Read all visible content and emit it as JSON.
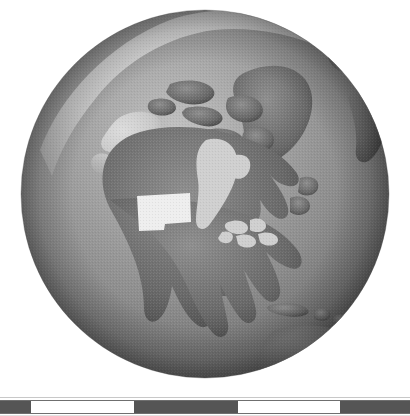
{
  "figure": {
    "kind": "globe-orthographic-projection",
    "view_center": "North America",
    "background_color": "#ffffff",
    "rendering": "grayscale halftone raster"
  },
  "globe": {
    "center_x": 205,
    "center_y": 194,
    "radius": 184,
    "ocean_color": "#8b8b8b",
    "ocean_shadow_color": "#5f5f5f",
    "ocean_highlight_color": "#b9b9b9",
    "land_color": "#6e6e6e",
    "land_shadow_color": "#4e4e4e",
    "ice_color": "#c9c9c9",
    "inland_water_color": "#cfcfcf",
    "highlight_color": "#eeeeee",
    "terminator_color": "#4a4a4a",
    "features": [
      {
        "name": "arctic-ice-cap",
        "tone": "ice"
      },
      {
        "name": "greenland",
        "tone": "land"
      },
      {
        "name": "canada",
        "tone": "land"
      },
      {
        "name": "alaska",
        "tone": "ice"
      },
      {
        "name": "hudson-bay",
        "tone": "inland-water"
      },
      {
        "name": "great-lakes",
        "tone": "inland-water"
      },
      {
        "name": "united-states",
        "tone": "land"
      },
      {
        "name": "mexico",
        "tone": "land"
      },
      {
        "name": "central-america",
        "tone": "land"
      },
      {
        "name": "south-america-north",
        "tone": "land"
      },
      {
        "name": "caribbean-islands",
        "tone": "land"
      },
      {
        "name": "northern-europe-limb",
        "tone": "land"
      },
      {
        "name": "highlighted-state",
        "tone": "highlight"
      }
    ]
  },
  "highlight": {
    "label": "highlighted-state",
    "color": "#eeeeee",
    "bounds": {
      "x": 135,
      "y": 193,
      "width": 56,
      "height": 38
    }
  },
  "scale_bar": {
    "name": "distance-scale-bar",
    "total_width": 410,
    "height": 14,
    "dark_color": "#555555",
    "light_color": "#ffffff",
    "border_color": "#6f6f6f",
    "segments": [
      {
        "index": 0,
        "fill": "dark",
        "start": 0,
        "end": 31
      },
      {
        "index": 1,
        "fill": "light",
        "start": 31,
        "end": 134
      },
      {
        "index": 2,
        "fill": "dark",
        "start": 134,
        "end": 238
      },
      {
        "index": 3,
        "fill": "light",
        "start": 238,
        "end": 340
      },
      {
        "index": 4,
        "fill": "dark",
        "start": 340,
        "end": 410
      }
    ]
  }
}
